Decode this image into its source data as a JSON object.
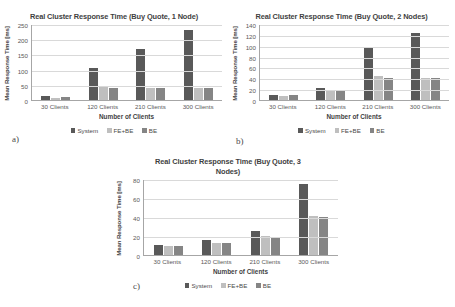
{
  "panels": [
    {
      "tag": "a)",
      "title": "Real Cluster Response Time (Buy Quote, 1 Node)",
      "chart_data": {
        "type": "bar",
        "title": "Real Cluster Response Time (Buy Quote, 1 Node)",
        "xlabel": "Number of Clients",
        "ylabel": "Mean Response Time [ms]",
        "categories": [
          "30 Clients",
          "120 Clients",
          "210 Clients",
          "300 Clients"
        ],
        "series": [
          {
            "name": "System",
            "values": [
              12,
              104,
              167,
              231
            ]
          },
          {
            "name": "FE+BE",
            "values": [
              8,
              42,
              39,
              40
            ]
          },
          {
            "name": "BE",
            "values": [
              10,
              39,
              38,
              40
            ]
          }
        ],
        "ylim": [
          0,
          250
        ],
        "yticks": [
          0,
          50,
          100,
          150,
          200,
          250
        ],
        "grid": true,
        "legend_position": "bottom"
      }
    },
    {
      "tag": "b)",
      "title": "Real Cluster Response Time (Buy Quote, 2 Nodes)",
      "chart_data": {
        "type": "bar",
        "title": "Real Cluster Response Time (Buy Quote, 2 Nodes)",
        "xlabel": "Number of Clients",
        "ylabel": "Mean Response Time [ms]",
        "categories": [
          "30 Clients",
          "120 Clients",
          "210 Clients",
          "300 Clients"
        ],
        "series": [
          {
            "name": "System",
            "values": [
              10,
              23,
              95,
              123
            ]
          },
          {
            "name": "FE+BE",
            "values": [
              7,
              18,
              45,
              41
            ]
          },
          {
            "name": "BE",
            "values": [
              9,
              18,
              41,
              41
            ]
          }
        ],
        "ylim": [
          0,
          140
        ],
        "yticks": [
          0,
          20,
          40,
          60,
          80,
          100,
          120,
          140
        ],
        "grid": true,
        "legend_position": "bottom"
      }
    },
    {
      "tag": "c)",
      "title": "Real Cluster Response Time (Buy Quote, 3 Nodes)",
      "chart_data": {
        "type": "bar",
        "title": "Real Cluster Response Time (Buy Quote, 3 Nodes)",
        "xlabel": "Number of Clients",
        "ylabel": "Mean Response Time [ms]",
        "categories": [
          "30 Clients",
          "120 Clients",
          "210 Clients",
          "300 Clients"
        ],
        "series": [
          {
            "name": "System",
            "values": [
              11,
              16,
              25,
              75
            ]
          },
          {
            "name": "FE+BE",
            "values": [
              9,
              13,
              20,
              41
            ]
          },
          {
            "name": "BE",
            "values": [
              9,
              13,
              19,
              40
            ]
          }
        ],
        "ylim": [
          0,
          80
        ],
        "yticks": [
          0,
          20,
          40,
          60,
          80
        ],
        "grid": true,
        "legend_position": "bottom"
      }
    }
  ],
  "colors": {
    "system": "#595959",
    "febe": "#bfbfbf",
    "be": "#858585",
    "gridline": "#d9d9d9",
    "axis": "#a6a6a6",
    "background": "#ffffff"
  }
}
